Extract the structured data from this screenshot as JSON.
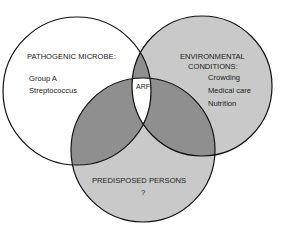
{
  "diagram": {
    "type": "venn",
    "colors": {
      "background": "#ffffff",
      "single_set_fill": "#c9c9c9",
      "left_set_fill": "#ffffff",
      "pair_overlap_fill": "#8f8f8f",
      "triple_overlap_fill": "#ffffff",
      "outline": "#111111"
    },
    "sets": [
      {
        "id": "pathogen",
        "title": "PATHOGENIC MICROBE:",
        "items": [
          "Group A",
          "Streptococcus"
        ]
      },
      {
        "id": "environment",
        "title_line1": "ENVIRONMENTAL",
        "title_line2": "CONDITIONS:",
        "items": [
          "Crowding",
          "Medical care",
          "Nutrition"
        ]
      },
      {
        "id": "host",
        "title": "PREDISPOSED PERSONS",
        "items": [
          "?"
        ]
      }
    ],
    "intersection": {
      "label": "ARF"
    }
  }
}
